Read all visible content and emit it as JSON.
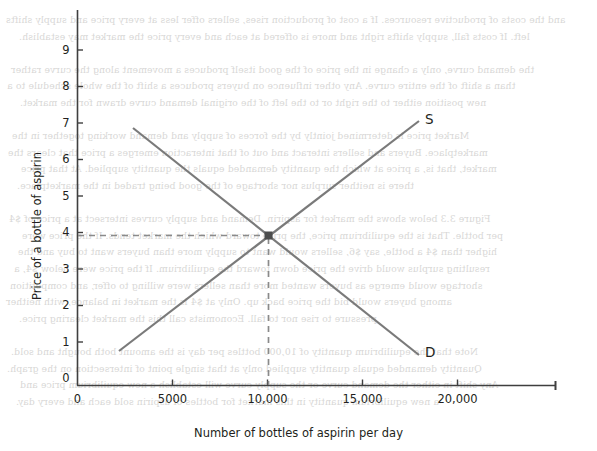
{
  "chart_data": {
    "type": "line",
    "title": "",
    "xlabel": "Number of bottles of aspirin per day",
    "ylabel": "Price of a bottle of aspirin",
    "xlim": [
      0,
      25000
    ],
    "ylim": [
      0,
      9.6
    ],
    "grid": false,
    "legend_position": "inline-curve-end",
    "xticks": [
      {
        "value": 0,
        "label": "0"
      },
      {
        "value": 5000,
        "label": "5000"
      },
      {
        "value": 10000,
        "label": "10,000"
      },
      {
        "value": 15000,
        "label": "15,000"
      },
      {
        "value": 20000,
        "label": "20,000"
      }
    ],
    "yticks": [
      {
        "value": 0,
        "label": "0"
      },
      {
        "value": 1,
        "label": "1"
      },
      {
        "value": 2,
        "label": "2"
      },
      {
        "value": 3,
        "label": "3"
      },
      {
        "value": 4,
        "label": "4"
      },
      {
        "value": 5,
        "label": "5"
      },
      {
        "value": 6,
        "label": "6"
      },
      {
        "value": 7,
        "label": "7"
      },
      {
        "value": 8,
        "label": "8"
      },
      {
        "value": 9,
        "label": "9"
      }
    ],
    "series": [
      {
        "name": "S",
        "label": "S",
        "description": "Supply curve, upward sloping",
        "color": "#7a7a7a",
        "points": [
          [
            2200,
            1.0
          ],
          [
            18000,
            7.0
          ]
        ]
      },
      {
        "name": "D",
        "label": "D",
        "description": "Demand curve, downward sloping",
        "color": "#7a7a7a",
        "points": [
          [
            3000,
            6.8
          ],
          [
            18000,
            1.1
          ]
        ]
      }
    ],
    "annotations": [
      {
        "type": "equilibrium-point",
        "x": 10000,
        "y": 4,
        "marker": "square",
        "color": "#4d4d4d"
      },
      {
        "type": "guide-line",
        "name": "price-guide",
        "orientation": "horizontal",
        "from": [
          0,
          4
        ],
        "to": [
          10000,
          4
        ],
        "style": "dashed",
        "color": "#8a8a8a"
      },
      {
        "type": "guide-line",
        "name": "quantity-guide",
        "orientation": "vertical",
        "from": [
          10000,
          0
        ],
        "to": [
          10000,
          4
        ],
        "style": "dashed",
        "color": "#8a8a8a"
      }
    ],
    "colors": {
      "curve": "#7a7a7a",
      "axis": "#3f3f3f",
      "text": "#231f20",
      "guide": "#8a8a8a",
      "marker": "#4d4d4d",
      "background": "#ffffff"
    }
  },
  "page": {
    "bleed_text": [
      "and the costs of productive resources. If a cost of production rises, sellers offer less at every price and supply shifts",
      "left. If costs fall, supply shifts right and more is offered at each and every price the market may establish.",
      "",
      "the demand curve, only a change in the price of the good itself produces a movement along the curve rather",
      "than a shift of the entire curve. Any other influence on buyers produces a shift of the whole schedule to a",
      "new position either to the right or to the left of the original demand curve drawn for the market.",
      "",
      "Market price is determined jointly by the forces of supply and demand working together in the",
      "marketplace. Buyers and sellers interact and out of that interaction emerges a price that clears the",
      "market, that is, a price at which the quantity demanded equals the quantity supplied. At that price",
      "there is neither surplus nor shortage of the good being traded in the marketplace.",
      "",
      "Figure 3.3 below shows the market for aspirin. Demand and supply curves intersect at a price of $4",
      "per bottle. That is the equilibrium price, the price toward which the market tends. If the price were",
      "higher than $4 a bottle, say $6, sellers would want to supply more than buyers want to buy and the",
      "resulting surplus would drive the price down toward the equilibrium. If the price were below $4, a",
      "shortage would emerge as buyers wanted more than sellers were willing to offer, and competition",
      "among buyers would bid the price back up. Only at $4 is the market in balance, with neither",
      "pressure to rise nor to fall. Economists call this the market clearing price.",
      "",
      "Note that the equilibrium quantity of 10,000 bottles per day is the amount both bought and sold.",
      "Quantity demanded equals quantity supplied only at that single point of intersection on the graph.",
      "Any shift in either the demand curve or the supply curve will establish a new equilibrium price and",
      "a new equilibrium quantity in this market for bottles of aspirin sold each and every day."
    ]
  }
}
